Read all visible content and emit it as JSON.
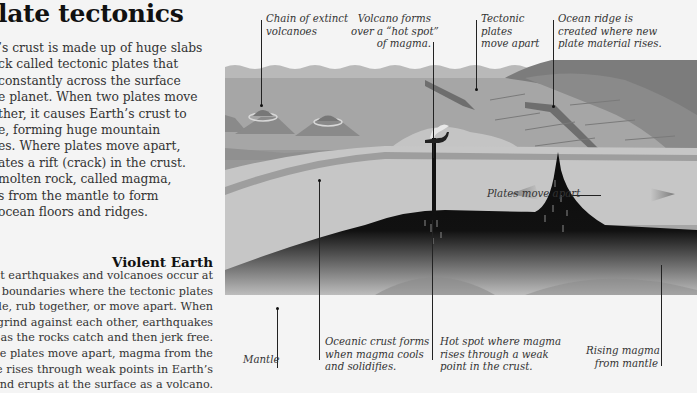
{
  "title": "late tectonics",
  "intro_lines": [
    "’s crust is made up of huge slabs",
    "ck called tectonic plates that",
    " constantly across the surface",
    "e planet. When two plates move",
    "ther, it causes Earth’s crust to",
    "e, forming huge mountain",
    "es. Where plates move apart,",
    "ates a rift (crack) in the crust.",
    " molten rock, called magma,",
    "s from the mantle to form",
    "ocean floors and ridges."
  ],
  "section": {
    "title": "Violent Earth",
    "lines": [
      "Most earthquakes and volcanoes occur at",
      "plate boundaries where the tectonic plates",
      "collide, rub together, or move apart. When",
      "lates grind against each other, earthquakes",
      "occur as the rocks catch and then jerk free.",
      "hen the plates move apart, magma from the",
      "mantle rises through weak points in Earth’s",
      "rust and erupts at the surface as a volcano."
    ]
  },
  "labels": {
    "extinct_volcanoes": [
      "Chain of extinct",
      "volcanoes"
    ],
    "hot_spot_volcano": [
      "Volcano forms",
      "over a “hot spot”",
      "of magma."
    ],
    "plates_apart_top": [
      "Tectonic",
      "plates",
      "move apart"
    ],
    "ocean_ridge": [
      "Ocean ridge is",
      "created where new",
      "plate material rises."
    ],
    "plates_move_apart": "Plates move apart",
    "mantle": "Mantle",
    "oceanic_crust": [
      "Oceanic crust forms",
      "when magma cools",
      "and solidifies."
    ],
    "hot_spot": [
      "Hot spot where magma",
      "rises through a weak",
      "point in the crust."
    ],
    "rising_magma": [
      "Rising magma",
      "from mantle"
    ]
  },
  "colors": {
    "background": "#f4f4f4",
    "sea_surface": "#b9b9b9",
    "sea": "#a3a3a3",
    "ocean_floor": "#8e8e8e",
    "crust_light": "#c8c8c8",
    "crust_band": "#9c9c9c",
    "mantle_dark": "#0c0c0c",
    "mantle_glow": "#cfcfcf",
    "land": "#7a7a7a"
  }
}
